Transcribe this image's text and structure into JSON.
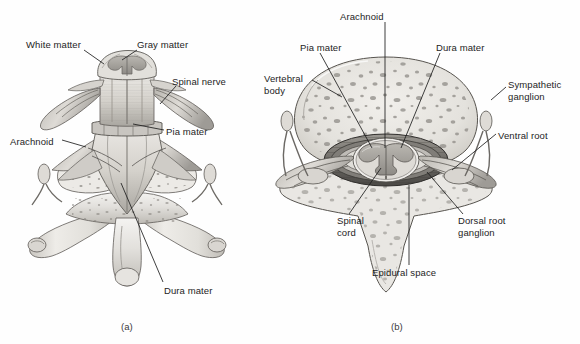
{
  "figure": {
    "background_color": "#fefefe",
    "ink_color": "#1d1d1d",
    "panels": [
      {
        "id": "a",
        "caption": "(a)",
        "description": "posterior view of spinal cord with meninges and vertebra",
        "labels": [
          {
            "name": "white-matter",
            "text": "White matter",
            "x": 26,
            "y": 39,
            "align": "left",
            "leader": [
              [
                84,
                50
              ],
              [
                104,
                64
              ]
            ]
          },
          {
            "name": "gray-matter",
            "text": "Gray matter",
            "x": 137,
            "y": 39,
            "align": "left",
            "leader": [
              [
                137,
                50
              ],
              [
                122,
                60
              ]
            ]
          },
          {
            "name": "spinal-nerve",
            "text": "Spinal nerve",
            "x": 172,
            "y": 76,
            "align": "left",
            "leader": [
              [
                176,
                86
              ],
              [
                160,
                104
              ]
            ]
          },
          {
            "name": "pia-mater",
            "text": "Pia mater",
            "x": 166,
            "y": 126,
            "align": "left",
            "leader": [
              [
                164,
                130
              ],
              [
                133,
                124
              ]
            ]
          },
          {
            "name": "arachnoid",
            "text": "Arachnoid",
            "x": 10,
            "y": 136,
            "align": "left",
            "leader": [
              [
                62,
                140
              ],
              [
                86,
                147
              ]
            ]
          },
          {
            "name": "dura-mater",
            "text": "Dura mater",
            "x": 164,
            "y": 285,
            "align": "left",
            "leader": [
              [
                163,
                282
              ],
              [
                121,
                183
              ]
            ]
          }
        ]
      },
      {
        "id": "b",
        "caption": "(b)",
        "description": "superior transverse section through vertebra and spinal cord",
        "labels": [
          {
            "name": "arachnoid",
            "text": "Arachnoid",
            "x": 340,
            "y": 11,
            "align": "left",
            "leader": [
              [
                385,
                22
              ],
              [
                385,
                148
              ]
            ]
          },
          {
            "name": "pia-mater",
            "text": "Pia mater",
            "x": 300,
            "y": 42,
            "align": "left",
            "leader": [
              [
                320,
                53
              ],
              [
                372,
                148
              ]
            ]
          },
          {
            "name": "dura-mater",
            "text": "Dura mater",
            "x": 436,
            "y": 42,
            "align": "left",
            "leader": [
              [
                440,
                53
              ],
              [
                401,
                148
              ]
            ]
          },
          {
            "name": "vertebral-body",
            "text": "Vertebral\nbody",
            "x": 264,
            "y": 73,
            "align": "left",
            "leader": [
              [
                312,
                80
              ],
              [
                342,
                97
              ]
            ]
          },
          {
            "name": "sympathetic-ganglion",
            "text": "Sympathetic\nganglion",
            "x": 508,
            "y": 79,
            "align": "left",
            "leader": [
              [
                506,
                87
              ],
              [
                491,
                100
              ]
            ]
          },
          {
            "name": "ventral-root",
            "text": "Ventral root",
            "x": 498,
            "y": 130,
            "align": "left",
            "leader": [
              [
                496,
                134
              ],
              [
                452,
                170
              ]
            ]
          },
          {
            "name": "spinal-cord",
            "text": "Spinal\ncord",
            "x": 337,
            "y": 215,
            "align": "left",
            "leader": [
              [
                349,
                214
              ],
              [
                381,
                168
              ]
            ]
          },
          {
            "name": "dorsal-root-ganglion",
            "text": "Dorsal root\nganglion",
            "x": 458,
            "y": 215,
            "align": "left",
            "leader": [
              [
                463,
                214
              ],
              [
                427,
                172
              ]
            ]
          },
          {
            "name": "epidural-space",
            "text": "Epidural space",
            "x": 372,
            "y": 267,
            "align": "left",
            "leader": [
              [
                409,
                265
              ],
              [
                409,
                185
              ]
            ]
          }
        ]
      }
    ]
  }
}
